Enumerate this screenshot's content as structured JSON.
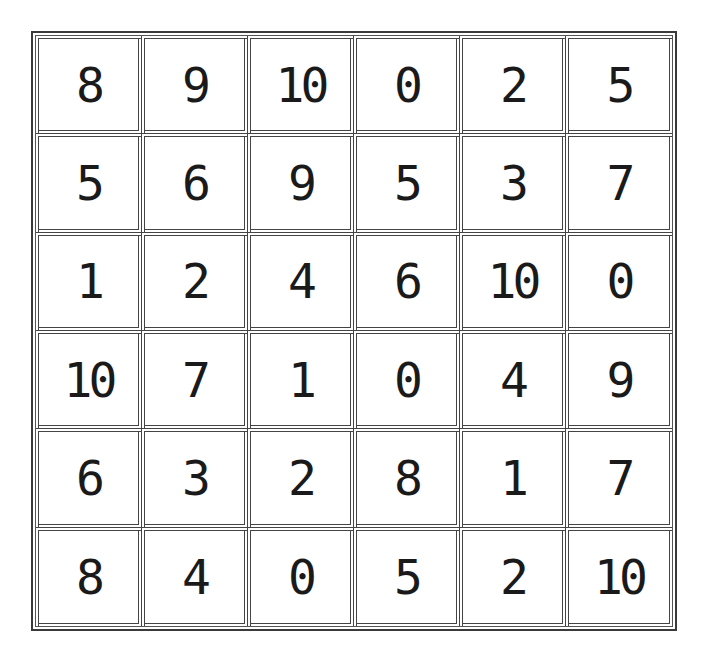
{
  "puzzle": {
    "rows": 6,
    "cols": 6,
    "grid": [
      [
        "8",
        "9",
        "10",
        "0",
        "2",
        "5"
      ],
      [
        "5",
        "6",
        "9",
        "5",
        "3",
        "7"
      ],
      [
        "1",
        "2",
        "4",
        "6",
        "10",
        "0"
      ],
      [
        "10",
        "7",
        "1",
        "0",
        "4",
        "9"
      ],
      [
        "6",
        "3",
        "2",
        "8",
        "1",
        "7"
      ],
      [
        "8",
        "4",
        "0",
        "5",
        "2",
        "10"
      ]
    ]
  },
  "colors": {
    "line": "#3a3a3a",
    "digit": "#1a1a1a",
    "background": "#ffffff"
  }
}
